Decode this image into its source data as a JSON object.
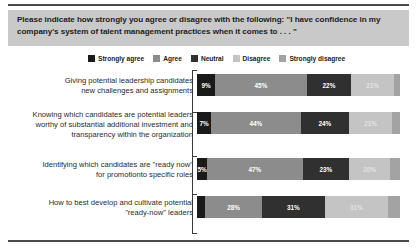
{
  "title": "Please indicate how strongly you agree or disagree with the following: \"I have confidence in my company's system of talent management practices when it comes to . . . \"",
  "legend": {
    "items": [
      {
        "label": "Strongly agree",
        "color": "#1a1a1a"
      },
      {
        "label": "Agree",
        "color": "#8c8c8c"
      },
      {
        "label": "Neutral",
        "color": "#303030"
      },
      {
        "label": "Disagree",
        "color": "#c4c4c4"
      },
      {
        "label": "Strongly disagree",
        "color": "#a3a3a3"
      }
    ]
  },
  "chart_data": {
    "type": "bar",
    "subtype": "stacked-horizontal-100",
    "title": "Please indicate how strongly you agree or disagree with the following: \"I have confidence in my company's system of talent management practices when it comes to . . . \"",
    "xlabel": "",
    "ylabel": "",
    "xlim": [
      0,
      100
    ],
    "grid": false,
    "legend_position": "top",
    "units": "percent",
    "categories": [
      "Giving potential leadership candidates new challenges and assignments",
      "Knowing which candidates are potential leaders worthy of substantial additional investment and transparency within the organization",
      "Identifying which candidates are \"ready now\" for promotionto specific roles",
      "How to best develop and cultivate potential \"ready-now\" leaders"
    ],
    "series": [
      {
        "name": "Strongly agree",
        "color": "#1a1a1a",
        "values": [
          9,
          7,
          5,
          4
        ]
      },
      {
        "name": "Agree",
        "color": "#8c8c8c",
        "values": [
          45,
          44,
          47,
          28
        ]
      },
      {
        "name": "Neutral",
        "color": "#303030",
        "values": [
          22,
          24,
          23,
          31
        ]
      },
      {
        "name": "Disagree",
        "color": "#c4c4c4",
        "values": [
          21,
          21,
          20,
          31
        ]
      },
      {
        "name": "Strongly disagree",
        "color": "#a3a3a3",
        "values": [
          3,
          4,
          5,
          6
        ]
      }
    ]
  },
  "rows": [
    {
      "label_lines": [
        "Giving potential leadership candidates",
        "new challenges and assignments"
      ],
      "segments": [
        {
          "name": "Strongly agree",
          "value": 9,
          "label": "9%",
          "color": "#1a1a1a",
          "text_color": "#ffffff",
          "show_label": true
        },
        {
          "name": "Agree",
          "value": 45,
          "label": "45%",
          "color": "#8c8c8c",
          "text_color": "#ffffff",
          "show_label": true
        },
        {
          "name": "Neutral",
          "value": 22,
          "label": "22%",
          "color": "#303030",
          "text_color": "#ffffff",
          "show_label": true
        },
        {
          "name": "Disagree",
          "value": 21,
          "label": "21%",
          "color": "#c4c4c4",
          "text_color": "#e2e2e2",
          "show_label": true
        },
        {
          "name": "Strongly disagree",
          "value": 3,
          "label": "",
          "color": "#a3a3a3",
          "text_color": "#ffffff",
          "show_label": false
        }
      ]
    },
    {
      "label_lines": [
        "Knowing which candidates are potential leaders",
        "worthy of substantial additional investment and",
        "transparency within the organization"
      ],
      "segments": [
        {
          "name": "Strongly agree",
          "value": 7,
          "label": "7%",
          "color": "#1a1a1a",
          "text_color": "#ffffff",
          "show_label": true
        },
        {
          "name": "Agree",
          "value": 44,
          "label": "44%",
          "color": "#8c8c8c",
          "text_color": "#ffffff",
          "show_label": true
        },
        {
          "name": "Neutral",
          "value": 24,
          "label": "24%",
          "color": "#303030",
          "text_color": "#ffffff",
          "show_label": true
        },
        {
          "name": "Disagree",
          "value": 21,
          "label": "21%",
          "color": "#c4c4c4",
          "text_color": "#e2e2e2",
          "show_label": true
        },
        {
          "name": "Strongly disagree",
          "value": 4,
          "label": "",
          "color": "#a3a3a3",
          "text_color": "#ffffff",
          "show_label": false
        }
      ]
    },
    {
      "label_lines": [
        "Identifying which candidates are \"ready now\"",
        "for promotionto specific roles"
      ],
      "segments": [
        {
          "name": "Strongly agree",
          "value": 5,
          "label": "5%",
          "color": "#1a1a1a",
          "text_color": "#ffffff",
          "show_label": true
        },
        {
          "name": "Agree",
          "value": 47,
          "label": "47%",
          "color": "#8c8c8c",
          "text_color": "#ffffff",
          "show_label": true
        },
        {
          "name": "Neutral",
          "value": 23,
          "label": "23%",
          "color": "#303030",
          "text_color": "#ffffff",
          "show_label": true
        },
        {
          "name": "Disagree",
          "value": 20,
          "label": "20%",
          "color": "#c4c4c4",
          "text_color": "#e2e2e2",
          "show_label": true
        },
        {
          "name": "Strongly disagree",
          "value": 5,
          "label": "",
          "color": "#a3a3a3",
          "text_color": "#ffffff",
          "show_label": false
        }
      ]
    },
    {
      "label_lines": [
        "How to best develop and cultivate potential",
        "\"ready-now\" leaders"
      ],
      "segments": [
        {
          "name": "Strongly agree",
          "value": 4,
          "label": "",
          "color": "#1a1a1a",
          "text_color": "#ffffff",
          "show_label": false
        },
        {
          "name": "Agree",
          "value": 28,
          "label": "28%",
          "color": "#8c8c8c",
          "text_color": "#ffffff",
          "show_label": true
        },
        {
          "name": "Neutral",
          "value": 31,
          "label": "31%",
          "color": "#303030",
          "text_color": "#ffffff",
          "show_label": true
        },
        {
          "name": "Disagree",
          "value": 31,
          "label": "31%",
          "color": "#c4c4c4",
          "text_color": "#e2e2e2",
          "show_label": true
        },
        {
          "name": "Strongly disagree",
          "value": 6,
          "label": "",
          "color": "#a3a3a3",
          "text_color": "#ffffff",
          "show_label": false
        }
      ]
    }
  ]
}
